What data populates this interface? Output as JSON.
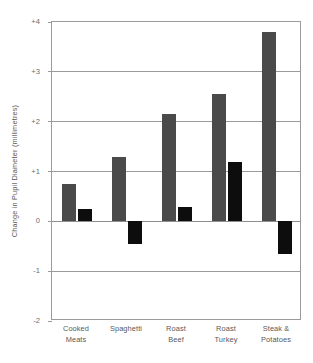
{
  "chart_data": {
    "type": "bar",
    "title": "",
    "subtitle": "",
    "xlabel": "",
    "ylabel": "Change in Pupil Diameter (millimetres)",
    "ylim": [
      -2,
      4
    ],
    "yticks": [
      "+4",
      "+3",
      "+2",
      "+1",
      "0",
      "-1",
      "-2"
    ],
    "ytick_values": [
      4,
      3,
      2,
      1,
      0,
      -1,
      -2
    ],
    "grid": "horizontal",
    "legend": "none",
    "categories": [
      "Cooked Meats",
      "Spaghetti",
      "Roast Beef",
      "Roast Turkey",
      "Steak & Potatoes"
    ],
    "category_lines": [
      [
        "Cooked",
        "Meats"
      ],
      [
        "Spaghetti",
        ""
      ],
      [
        "Roast",
        "Beef"
      ],
      [
        "Roast",
        "Turkey"
      ],
      [
        "Steak &",
        "Potatoes"
      ]
    ],
    "series": [
      {
        "name": "series-1",
        "color": "#4a4a4a",
        "values": [
          0.75,
          1.3,
          2.15,
          2.55,
          3.8
        ]
      },
      {
        "name": "series-2",
        "color": "#0d0d0d",
        "values": [
          0.25,
          -0.45,
          0.28,
          1.2,
          -0.65
        ]
      }
    ],
    "colors": {
      "series_1": "#4a4a4a",
      "series_2": "#0d0d0d",
      "axis": "#9b9b9b",
      "text": "#58585a",
      "background": "#ffffff"
    }
  }
}
